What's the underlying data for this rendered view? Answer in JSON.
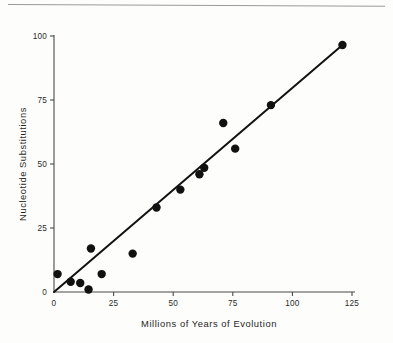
{
  "figure": {
    "background_color": "#fdfdfb",
    "ink_color": "#111111",
    "rule_color": "#9a9a9a"
  },
  "chart_data": {
    "type": "scatter",
    "title": "",
    "subtitle": "",
    "xlabel": "Millions of Years of Evolution",
    "ylabel": "Nucleotide Substitutions",
    "xlim": [
      0,
      125
    ],
    "ylim": [
      0,
      100
    ],
    "xticks": [
      0,
      25,
      50,
      75,
      100,
      125
    ],
    "yticks": [
      0,
      25,
      50,
      75,
      100
    ],
    "xtick_labels": [
      "0",
      "25",
      "50",
      "75",
      "100",
      "125"
    ],
    "ytick_labels": [
      "0",
      "25",
      "50",
      "75",
      "100"
    ],
    "grid": false,
    "legend": null,
    "legend_position": "none",
    "tick_direction": "out",
    "marker": "filled-circle",
    "marker_size_px": 4.2,
    "points": [
      {
        "x": 1.5,
        "y": 7.0
      },
      {
        "x": 7.0,
        "y": 4.0
      },
      {
        "x": 11.0,
        "y": 3.5
      },
      {
        "x": 14.5,
        "y": 1.0
      },
      {
        "x": 15.5,
        "y": 17.0
      },
      {
        "x": 20.0,
        "y": 7.0
      },
      {
        "x": 33.0,
        "y": 15.0
      },
      {
        "x": 43.0,
        "y": 33.0
      },
      {
        "x": 53.0,
        "y": 40.0
      },
      {
        "x": 61.0,
        "y": 46.0
      },
      {
        "x": 63.0,
        "y": 48.5
      },
      {
        "x": 71.0,
        "y": 66.0
      },
      {
        "x": 76.0,
        "y": 56.0
      },
      {
        "x": 91.0,
        "y": 73.0
      },
      {
        "x": 121.0,
        "y": 96.5
      }
    ],
    "fit_line": {
      "type": "linear-through-origin",
      "x_start": 0,
      "y_start": 0,
      "x_end": 121,
      "y_end": 96.5
    }
  }
}
